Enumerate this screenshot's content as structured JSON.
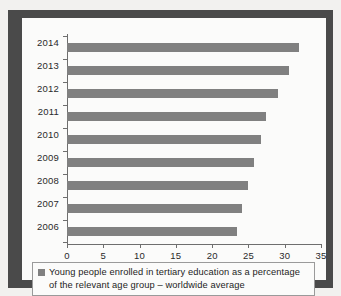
{
  "figure": {
    "legend": {
      "swatch_color": "#808080",
      "text": "Young people enrolled in tertiary education as a percentage of the relevant age group – worldwide average"
    }
  },
  "chart_data": {
    "type": "bar",
    "orientation": "horizontal",
    "title": "",
    "subtitle": "",
    "xlabel": "",
    "ylabel": "",
    "categories": [
      "2014",
      "2013",
      "2012",
      "2011",
      "2010",
      "2009",
      "2008",
      "2007",
      "2006"
    ],
    "values": [
      32.0,
      30.6,
      29.1,
      27.4,
      26.7,
      25.8,
      24.9,
      24.1,
      23.4
    ],
    "series": [
      {
        "name": "Young people enrolled in tertiary education as a percentage of the relevant age group – worldwide average",
        "color": "#808080",
        "values": [
          32.0,
          30.6,
          29.1,
          27.4,
          26.7,
          25.8,
          24.9,
          24.1,
          23.4
        ]
      }
    ],
    "xlim": [
      0,
      35
    ],
    "xticks": [
      0,
      5,
      10,
      15,
      20,
      25,
      30,
      35
    ],
    "xtick_labels": [
      "0",
      "5",
      "10",
      "15",
      "20",
      "25",
      "30",
      "35"
    ],
    "grid": false,
    "legend_position": "bottom",
    "bar_color": "#808080",
    "axis_color": "#6e6e6e",
    "plot_background": "#fbfbfa"
  }
}
